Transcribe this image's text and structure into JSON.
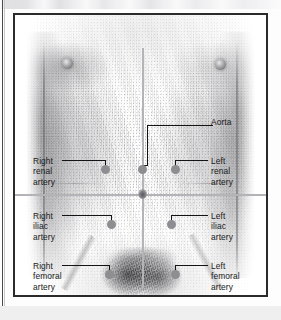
{
  "figure": {
    "type": "anatomical-illustration",
    "view": "anterior",
    "reference_lines": {
      "vertical": "body midline",
      "horizontal": "umbilical level"
    }
  },
  "callouts": [
    {
      "id": "aorta",
      "label": "Aorta",
      "side": "right",
      "label_x": 196,
      "label_y": 102,
      "dot_x": 123,
      "dot_y": 150,
      "lines": [
        {
          "o": "h",
          "x": 132,
          "y": 110,
          "w": 66
        },
        {
          "o": "v",
          "x": 132,
          "y": 110,
          "h": 40
        },
        {
          "o": "h",
          "x": 127,
          "y": 150,
          "w": 6
        }
      ]
    },
    {
      "id": "right-renal-artery",
      "label": "Right\nrenal\nartery",
      "side": "left",
      "label_x": 18,
      "label_y": 141,
      "dot_x": 86,
      "dot_y": 150,
      "lines": [
        {
          "o": "h",
          "x": 47,
          "y": 145,
          "w": 43
        },
        {
          "o": "v",
          "x": 90,
          "y": 145,
          "h": 6
        }
      ]
    },
    {
      "id": "left-renal-artery",
      "label": "Left\nrenal\nartery",
      "side": "right",
      "label_x": 196,
      "label_y": 141,
      "dot_x": 156,
      "dot_y": 150,
      "lines": [
        {
          "o": "h",
          "x": 160,
          "y": 145,
          "w": 33
        },
        {
          "o": "v",
          "x": 160,
          "y": 145,
          "h": 6
        }
      ]
    },
    {
      "id": "right-iliac-artery",
      "label": "Right\niliac\nartery",
      "side": "left",
      "label_x": 18,
      "label_y": 196,
      "dot_x": 92,
      "dot_y": 205,
      "lines": [
        {
          "o": "h",
          "x": 47,
          "y": 200,
          "w": 49
        },
        {
          "o": "v",
          "x": 96,
          "y": 200,
          "h": 6
        }
      ]
    },
    {
      "id": "left-iliac-artery",
      "label": "Left\niliac\nartery",
      "side": "right",
      "label_x": 196,
      "label_y": 196,
      "dot_x": 152,
      "dot_y": 205,
      "lines": [
        {
          "o": "h",
          "x": 156,
          "y": 200,
          "w": 37
        },
        {
          "o": "v",
          "x": 156,
          "y": 200,
          "h": 6
        }
      ]
    },
    {
      "id": "right-femoral-artery",
      "label": "Right\nfemoral\nartery",
      "side": "left",
      "label_x": 18,
      "label_y": 246,
      "dot_x": 90,
      "dot_y": 255,
      "lines": [
        {
          "o": "h",
          "x": 47,
          "y": 250,
          "w": 47
        },
        {
          "o": "v",
          "x": 94,
          "y": 250,
          "h": 6
        }
      ]
    },
    {
      "id": "left-femoral-artery",
      "label": "Left\nfemoral\nartery",
      "side": "right",
      "label_x": 196,
      "label_y": 246,
      "dot_x": 156,
      "dot_y": 255,
      "lines": [
        {
          "o": "h",
          "x": 160,
          "y": 250,
          "w": 33
        },
        {
          "o": "v",
          "x": 160,
          "y": 250,
          "h": 6
        }
      ]
    }
  ],
  "colors": {
    "frame_border": "#2b2b2b",
    "leader_line": "#141414",
    "marker_dot": "#8e8e92",
    "reference_line": "#b4b4b8",
    "label_text": "#1a1a1a",
    "page_background": "#ffffff",
    "page_bottom_band": "#efeff0"
  },
  "labels": {
    "aorta": "Aorta",
    "right_renal": "Right\nrenal\nartery",
    "left_renal": "Left\nrenal\nartery",
    "right_iliac": "Right\niliac\nartery",
    "left_iliac": "Left\niliac\nartery",
    "right_femoral": "Right\nfemoral\nartery",
    "left_femoral": "Left\nfemoral\nartery"
  }
}
